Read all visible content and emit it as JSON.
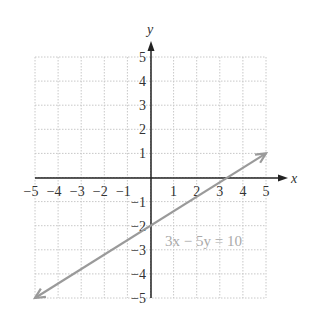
{
  "chart_data": {
    "type": "line",
    "title": "",
    "xlabel": "x",
    "ylabel": "y",
    "xlim": [
      -5,
      5
    ],
    "ylim": [
      -5,
      5
    ],
    "grid": true,
    "x_ticks": [
      "−5",
      "−4",
      "−3",
      "−2",
      "−1",
      "1",
      "2",
      "3",
      "4",
      "5"
    ],
    "y_ticks": [
      "5",
      "4",
      "3",
      "2",
      "1",
      "−1",
      "−2",
      "−3",
      "−4",
      "−5"
    ],
    "series": [
      {
        "name": "3x − 5y = 10",
        "equation": "3x − 5y = 10",
        "x": [
          -5,
          5
        ],
        "y": [
          -5,
          1
        ],
        "arrows": "both"
      }
    ],
    "annotations": [
      {
        "text": "3x − 5y = 10",
        "x": 0.5,
        "y": -2.4
      }
    ],
    "colors": {
      "line": "#9a9a9a",
      "grid": "#c8c8c8",
      "axis": "#222222",
      "annotation": "#aaaaaa"
    }
  }
}
